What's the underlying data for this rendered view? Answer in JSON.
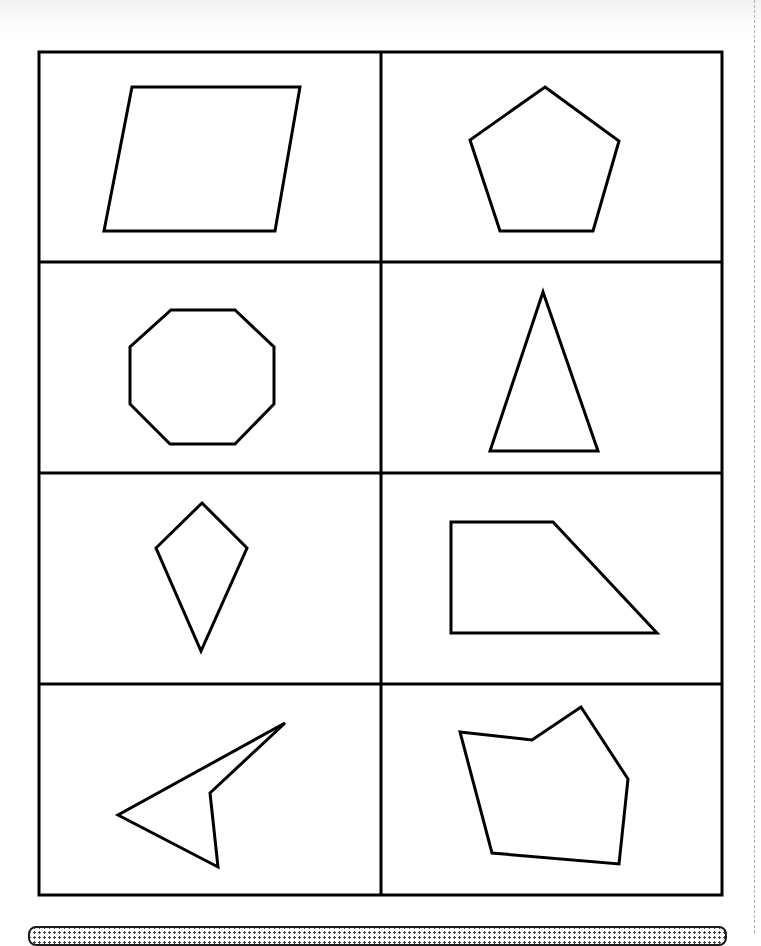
{
  "worksheet": {
    "grid": {
      "rows": 4,
      "columns": 2,
      "outer_box": {
        "x": 39,
        "y": 52,
        "width": 683,
        "height": 843
      },
      "column_divider_x": 381,
      "row_divider_y": [
        262,
        473,
        684
      ],
      "stroke_color": "#000000"
    },
    "cells": [
      {
        "id": "r1c1",
        "shape": "parallelogram",
        "points": "132,87 300,87 275,231 104,231"
      },
      {
        "id": "r1c2",
        "shape": "regular-pentagon",
        "points": "545,87 619,141 593,231 500,231 470,140"
      },
      {
        "id": "r2c1",
        "shape": "octagon",
        "points": "171,310 235,310 274,347 274,404 235,444 170,444 130,404 130,347"
      },
      {
        "id": "r2c2",
        "shape": "isosceles-triangle",
        "points": "543,292 598,451 490,451"
      },
      {
        "id": "r3c1",
        "shape": "kite",
        "points": "202,503 247,548 201,651 156,548"
      },
      {
        "id": "r3c2",
        "shape": "right-trapezoid",
        "points": "451,522 553,522 657,633 451,633"
      },
      {
        "id": "r4c1",
        "shape": "concave-quadrilateral-dart",
        "points": "285,723 210,793 218,867 118,815"
      },
      {
        "id": "r4c2",
        "shape": "concave-hexagon",
        "points": "460,732 532,740 581,707 628,779 619,864 492,853"
      }
    ],
    "shape_stroke_width": 3,
    "border_stroke_width": 3
  }
}
